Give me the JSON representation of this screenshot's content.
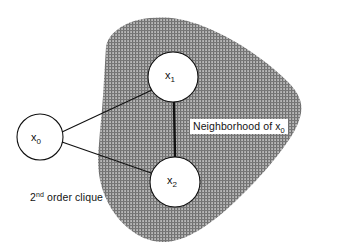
{
  "figure": {
    "background_color": "#ffffff",
    "line_color": "#111111",
    "shade_color": "#8c8c8c",
    "node_fill": "#ffffff"
  },
  "nodes": [
    {
      "id": "x0",
      "base": "x",
      "subscript": "0",
      "cx": 40,
      "cy": 137,
      "r": 23,
      "inside_neighborhood": false
    },
    {
      "id": "x1",
      "base": "x",
      "subscript": "1",
      "cx": 173,
      "cy": 77,
      "r": 25,
      "inside_neighborhood": true
    },
    {
      "id": "x2",
      "base": "x",
      "subscript": "2",
      "cx": 175,
      "cy": 182,
      "r": 25,
      "inside_neighborhood": true
    }
  ],
  "edges": [
    {
      "id": "edge-x0-x1",
      "from": "x0",
      "to": "x1",
      "width": 1
    },
    {
      "id": "edge-x0-x2",
      "from": "x0",
      "to": "x2",
      "width": 1
    },
    {
      "id": "edge-x1-x2",
      "from": "x1",
      "to": "x2",
      "width": 2.4
    }
  ],
  "region": {
    "id": "neighborhood-region",
    "name": "shaded neighborhood blob",
    "fill_pattern": "crosshatch-gray"
  },
  "captions": {
    "clique": {
      "prefix": "2",
      "ordinal": "nd",
      "suffix": " order clique"
    },
    "neighborhood": {
      "prefix": "Neighborhood of x",
      "subscript": "0"
    }
  }
}
